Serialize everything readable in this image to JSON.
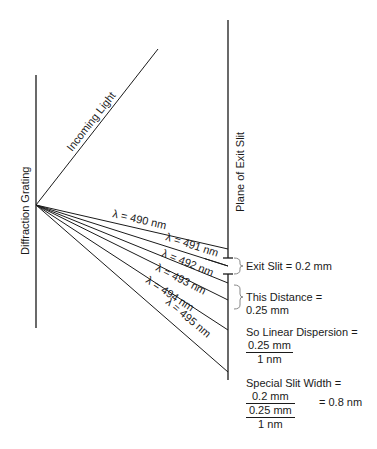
{
  "labels": {
    "grating": "Diffraction Grating",
    "incoming": "Incoming Light",
    "exit_plane": "Plane of Exit Slit"
  },
  "rays": [
    {
      "label": "λ = 490 nm"
    },
    {
      "label": "λ = 491 nm"
    },
    {
      "label": "λ = 492 nm"
    },
    {
      "label": "λ = 493 nm"
    },
    {
      "label": "λ = 494 nm"
    },
    {
      "label": "λ = 495 nm"
    }
  ],
  "annotations": {
    "exit_slit": "Exit Slit = 0.2 mm",
    "distance_line1": "This Distance =",
    "distance_line2": "0.25 mm",
    "dispersion_line1": "So Linear Dispersion =",
    "dispersion_num": "0.25 mm",
    "dispersion_den": "1 nm",
    "special_line1": "Special Slit Width =",
    "special_num": "0.2 mm",
    "special_den_num": "0.25 mm",
    "special_den_den": "1 nm",
    "special_result": "= 0.8 nm"
  },
  "colors": {
    "line": "#1a1a1a",
    "bracket": "#888888"
  }
}
